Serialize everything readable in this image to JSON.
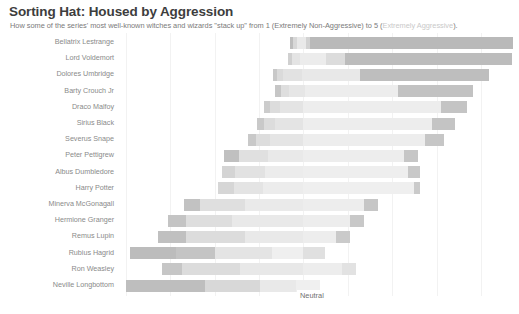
{
  "header": {
    "title": "Sorting Hat: Housed by Aggression",
    "subtitle_main": "How some of the series' most well-known witches and wizards \"stack up\" from 1 (Extremely Non-Aggressive) to 5 (",
    "subtitle_faded": "Extremely Aggressive",
    "subtitle_tail": ")."
  },
  "axis": {
    "neutral_label": "Neutral",
    "gridlines": [
      126,
      170,
      215,
      259,
      303,
      348,
      392,
      437,
      481
    ]
  },
  "colors": {
    "scale_1": "#a8a8a8",
    "scale_2": "#c8c8c8",
    "scale_3": "#e0e0e0",
    "scale_4": "#eeeeee",
    "scale_5": "#b9b9b9",
    "neutral_mid": "#ededed",
    "grid": "#f2f2f2",
    "title": "#3d3d3d",
    "subtitle": "#7a7a7a",
    "subtitle_faded": "#c9c9c9",
    "label": "#8a8a8a"
  },
  "chart_data": {
    "type": "bar",
    "subtype": "diverging-stacked-likert",
    "title": "Sorting Hat: Housed by Aggression",
    "subtitle": "How some of the series' most well-known witches and wizards \"stack up\" from 1 (Extremely Non-Aggressive) to 5 (Extremely Aggressive).",
    "xlabel": "",
    "ylabel": "",
    "grid": true,
    "legend": "none",
    "neutral_center_label": "Neutral",
    "scale": {
      "min": 1,
      "max": 5,
      "min_label": "Extremely Non-Aggressive",
      "max_label": "Extremely Aggressive",
      "levels": [
        1,
        2,
        3,
        4,
        5
      ]
    },
    "series": [
      {
        "name": "1 (Extremely Non-Aggressive)",
        "color": "#a8a8a8"
      },
      {
        "name": "2",
        "color": "#c8c8c8"
      },
      {
        "name": "3 (Neutral)",
        "color": "#e6e6e6"
      },
      {
        "name": "4",
        "color": "#efefef"
      },
      {
        "name": "5 (Extremely Aggressive)",
        "color": "#b9b9b9"
      }
    ],
    "categories": [
      "Bellatrix Lestrange",
      "Lord Voldemort",
      "Dolores Umbridge",
      "Barty Crouch Jr",
      "Draco Malfoy",
      "Sirius Black",
      "Severus Snape",
      "Peter Pettigrew",
      "Albus Dumbledore",
      "Harry Potter",
      "Minerva McGonagall",
      "Hermione Granger",
      "Remus Lupin",
      "Rubius Hagrid",
      "Ron Weasley",
      "Neville Longbottom"
    ],
    "rows": [
      {
        "category": "Bellatrix Lestrange",
        "bar_start_px": 290,
        "bar_end_px": 513,
        "segments": [
          {
            "level": 1,
            "start_px": 290,
            "end_px": 293,
            "color": "#bdbdbd"
          },
          {
            "level": 2,
            "start_px": 293,
            "end_px": 297,
            "color": "#d8d8d8"
          },
          {
            "level": 3,
            "start_px": 297,
            "end_px": 306,
            "color": "#e9e9e9"
          },
          {
            "level": 4,
            "start_px": 306,
            "end_px": 310,
            "color": "#d2d2d2"
          },
          {
            "level": 5,
            "start_px": 310,
            "end_px": 513,
            "color": "#b9b9b9"
          }
        ]
      },
      {
        "category": "Lord Voldemort",
        "bar_start_px": 288,
        "bar_end_px": 512,
        "segments": [
          {
            "level": 1,
            "start_px": 288,
            "end_px": 292,
            "color": "#d0d0d0"
          },
          {
            "level": 2,
            "start_px": 292,
            "end_px": 300,
            "color": "#e4e4e4"
          },
          {
            "level": 3,
            "start_px": 300,
            "end_px": 326,
            "color": "#ececec"
          },
          {
            "level": 4,
            "start_px": 326,
            "end_px": 345,
            "color": "#dcdcdc"
          },
          {
            "level": 5,
            "start_px": 345,
            "end_px": 512,
            "color": "#bcbcbc"
          }
        ]
      },
      {
        "category": "Dolores Umbridge",
        "bar_start_px": 273,
        "bar_end_px": 489,
        "segments": [
          {
            "level": 1,
            "start_px": 273,
            "end_px": 277,
            "color": "#c8c8c8"
          },
          {
            "level": 2,
            "start_px": 277,
            "end_px": 283,
            "color": "#dadada"
          },
          {
            "level": 3,
            "start_px": 283,
            "end_px": 302,
            "color": "#e2e2e2"
          },
          {
            "level": 4,
            "start_px": 302,
            "end_px": 360,
            "color": "#e8e8e8"
          },
          {
            "level": 5,
            "start_px": 360,
            "end_px": 489,
            "color": "#bebebe"
          }
        ]
      },
      {
        "category": "Barty Crouch Jr",
        "bar_start_px": 275,
        "bar_end_px": 473,
        "segments": [
          {
            "level": 1,
            "start_px": 275,
            "end_px": 281,
            "color": "#c6c6c6"
          },
          {
            "level": 2,
            "start_px": 281,
            "end_px": 289,
            "color": "#dedede"
          },
          {
            "level": 3,
            "start_px": 289,
            "end_px": 305,
            "color": "#e6e6e6"
          },
          {
            "level": 4,
            "start_px": 305,
            "end_px": 398,
            "color": "#ededed"
          },
          {
            "level": 5,
            "start_px": 398,
            "end_px": 473,
            "color": "#c2c2c2"
          }
        ]
      },
      {
        "category": "Draco Malfoy",
        "bar_start_px": 264,
        "bar_end_px": 467,
        "segments": [
          {
            "level": 1,
            "start_px": 264,
            "end_px": 270,
            "color": "#cccccc"
          },
          {
            "level": 2,
            "start_px": 270,
            "end_px": 280,
            "color": "#dcdcdc"
          },
          {
            "level": 3,
            "start_px": 280,
            "end_px": 303,
            "color": "#e4e4e4"
          },
          {
            "level": 4,
            "start_px": 303,
            "end_px": 441,
            "color": "#ededed"
          },
          {
            "level": 5,
            "start_px": 441,
            "end_px": 467,
            "color": "#c4c4c4"
          }
        ]
      },
      {
        "category": "Sirius Black",
        "bar_start_px": 257,
        "bar_end_px": 455,
        "segments": [
          {
            "level": 1,
            "start_px": 257,
            "end_px": 264,
            "color": "#c9c9c9"
          },
          {
            "level": 2,
            "start_px": 264,
            "end_px": 275,
            "color": "#dcdcdc"
          },
          {
            "level": 3,
            "start_px": 275,
            "end_px": 303,
            "color": "#e4e4e4"
          },
          {
            "level": 4,
            "start_px": 303,
            "end_px": 432,
            "color": "#ededed"
          },
          {
            "level": 5,
            "start_px": 432,
            "end_px": 455,
            "color": "#c4c4c4"
          }
        ]
      },
      {
        "category": "Severus Snape",
        "bar_start_px": 248,
        "bar_end_px": 444,
        "segments": [
          {
            "level": 1,
            "start_px": 248,
            "end_px": 256,
            "color": "#c9c9c9"
          },
          {
            "level": 2,
            "start_px": 256,
            "end_px": 270,
            "color": "#dddddd"
          },
          {
            "level": 3,
            "start_px": 270,
            "end_px": 303,
            "color": "#e5e5e5"
          },
          {
            "level": 4,
            "start_px": 303,
            "end_px": 425,
            "color": "#ededed"
          },
          {
            "level": 5,
            "start_px": 425,
            "end_px": 444,
            "color": "#c6c6c6"
          }
        ]
      },
      {
        "category": "Peter Pettigrew",
        "bar_start_px": 224,
        "bar_end_px": 418,
        "segments": [
          {
            "level": 1,
            "start_px": 224,
            "end_px": 239,
            "color": "#c0c0c0"
          },
          {
            "level": 2,
            "start_px": 239,
            "end_px": 268,
            "color": "#e0e0e0"
          },
          {
            "level": 3,
            "start_px": 268,
            "end_px": 303,
            "color": "#e9e9e9"
          },
          {
            "level": 4,
            "start_px": 303,
            "end_px": 404,
            "color": "#ededed"
          },
          {
            "level": 5,
            "start_px": 404,
            "end_px": 418,
            "color": "#c6c6c6"
          }
        ]
      },
      {
        "category": "Albus Dumbledore",
        "bar_start_px": 222,
        "bar_end_px": 420,
        "segments": [
          {
            "level": 1,
            "start_px": 222,
            "end_px": 235,
            "color": "#d4d4d4"
          },
          {
            "level": 2,
            "start_px": 235,
            "end_px": 265,
            "color": "#e2e2e2"
          },
          {
            "level": 3,
            "start_px": 265,
            "end_px": 303,
            "color": "#ececec"
          },
          {
            "level": 4,
            "start_px": 303,
            "end_px": 408,
            "color": "#eeeeee"
          },
          {
            "level": 5,
            "start_px": 408,
            "end_px": 420,
            "color": "#c8c8c8"
          }
        ]
      },
      {
        "category": "Harry Potter",
        "bar_start_px": 218,
        "bar_end_px": 420,
        "segments": [
          {
            "level": 1,
            "start_px": 218,
            "end_px": 234,
            "color": "#d6d6d6"
          },
          {
            "level": 2,
            "start_px": 234,
            "end_px": 263,
            "color": "#e4e4e4"
          },
          {
            "level": 3,
            "start_px": 263,
            "end_px": 303,
            "color": "#ececec"
          },
          {
            "level": 4,
            "start_px": 303,
            "end_px": 414,
            "color": "#efefef"
          },
          {
            "level": 5,
            "start_px": 414,
            "end_px": 420,
            "color": "#cacaca"
          }
        ]
      },
      {
        "category": "Minerva McGonagall",
        "bar_start_px": 184,
        "bar_end_px": 378,
        "segments": [
          {
            "level": 1,
            "start_px": 184,
            "end_px": 200,
            "color": "#c2c2c2"
          },
          {
            "level": 2,
            "start_px": 200,
            "end_px": 245,
            "color": "#dfdfdf"
          },
          {
            "level": 3,
            "start_px": 245,
            "end_px": 303,
            "color": "#eaeaea"
          },
          {
            "level": 4,
            "start_px": 303,
            "end_px": 364,
            "color": "#ededed"
          },
          {
            "level": 5,
            "start_px": 364,
            "end_px": 378,
            "color": "#c6c6c6"
          }
        ]
      },
      {
        "category": "Hermione Granger",
        "bar_start_px": 168,
        "bar_end_px": 364,
        "segments": [
          {
            "level": 1,
            "start_px": 168,
            "end_px": 186,
            "color": "#c4c4c4"
          },
          {
            "level": 2,
            "start_px": 186,
            "end_px": 232,
            "color": "#dedede"
          },
          {
            "level": 3,
            "start_px": 232,
            "end_px": 303,
            "color": "#e9e9e9"
          },
          {
            "level": 4,
            "start_px": 303,
            "end_px": 350,
            "color": "#ededed"
          },
          {
            "level": 5,
            "start_px": 350,
            "end_px": 364,
            "color": "#c8c8c8"
          }
        ]
      },
      {
        "category": "Remus Lupin",
        "bar_start_px": 158,
        "bar_end_px": 350,
        "segments": [
          {
            "level": 1,
            "start_px": 158,
            "end_px": 186,
            "color": "#c0c0c0"
          },
          {
            "level": 2,
            "start_px": 186,
            "end_px": 245,
            "color": "#dcdcdc"
          },
          {
            "level": 3,
            "start_px": 245,
            "end_px": 303,
            "color": "#e9e9e9"
          },
          {
            "level": 4,
            "start_px": 303,
            "end_px": 336,
            "color": "#ededed"
          },
          {
            "level": 5,
            "start_px": 336,
            "end_px": 350,
            "color": "#cacaca"
          }
        ]
      },
      {
        "category": "Rubius Hagrid",
        "bar_start_px": 130,
        "bar_end_px": 325,
        "segments": [
          {
            "level": 1,
            "start_px": 130,
            "end_px": 176,
            "color": "#bcbcbc"
          },
          {
            "level": 2,
            "start_px": 176,
            "end_px": 215,
            "color": "#c4c4c4"
          },
          {
            "level": 3,
            "start_px": 215,
            "end_px": 272,
            "color": "#e4e4e4"
          },
          {
            "level": 4,
            "start_px": 272,
            "end_px": 303,
            "color": "#efefef"
          },
          {
            "level": 5,
            "start_px": 303,
            "end_px": 325,
            "color": "#e0e0e0"
          }
        ]
      },
      {
        "category": "Ron Weasley",
        "bar_start_px": 162,
        "bar_end_px": 356,
        "segments": [
          {
            "level": 1,
            "start_px": 162,
            "end_px": 182,
            "color": "#c6c6c6"
          },
          {
            "level": 2,
            "start_px": 182,
            "end_px": 240,
            "color": "#dcdcdc"
          },
          {
            "level": 3,
            "start_px": 240,
            "end_px": 303,
            "color": "#e8e8e8"
          },
          {
            "level": 4,
            "start_px": 303,
            "end_px": 342,
            "color": "#ededed"
          },
          {
            "level": 5,
            "start_px": 342,
            "end_px": 356,
            "color": "#e2e2e2"
          }
        ]
      },
      {
        "category": "Neville Longbottom",
        "bar_start_px": 126,
        "bar_end_px": 320,
        "segments": [
          {
            "level": 1,
            "start_px": 126,
            "end_px": 205,
            "color": "#bebebe"
          },
          {
            "level": 2,
            "start_px": 205,
            "end_px": 260,
            "color": "#d8d8d8"
          },
          {
            "level": 3,
            "start_px": 260,
            "end_px": 296,
            "color": "#e9e9e9"
          },
          {
            "level": 4,
            "start_px": 296,
            "end_px": 310,
            "color": "#efefef"
          },
          {
            "level": 5,
            "start_px": 310,
            "end_px": 320,
            "color": "#f0f0f0"
          }
        ]
      }
    ]
  }
}
